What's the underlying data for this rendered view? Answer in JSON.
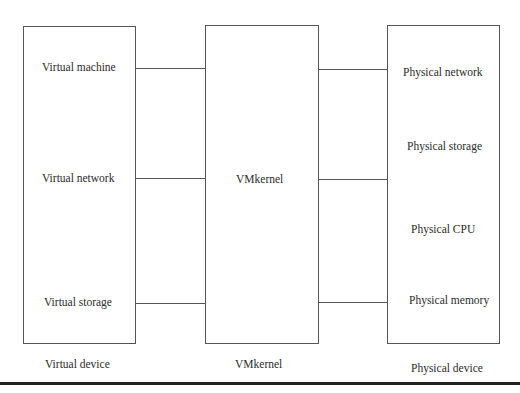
{
  "diagram": {
    "columns": [
      {
        "id": "virtual",
        "caption": "Virtual device",
        "items": [
          "Virtual machine",
          "Virtual network",
          "Virtual storage"
        ]
      },
      {
        "id": "vmkernel",
        "caption": "VMkernel",
        "items": [
          "VMkernel"
        ]
      },
      {
        "id": "physical",
        "caption": "Physical device",
        "items": [
          "Physical network",
          "Physical storage",
          "Physical CPU",
          "Physical memory"
        ]
      }
    ],
    "connections": [
      {
        "from": "Virtual machine",
        "to": "VMkernel"
      },
      {
        "from": "Virtual network",
        "to": "VMkernel"
      },
      {
        "from": "Virtual storage",
        "to": "VMkernel"
      },
      {
        "from": "VMkernel",
        "to": "Physical network"
      },
      {
        "from": "VMkernel",
        "to": "Physical CPU"
      },
      {
        "from": "VMkernel",
        "to": "Physical memory"
      }
    ],
    "colors": {
      "line": "#555555",
      "text": "#2b2b2b",
      "rule": "#222222"
    }
  }
}
